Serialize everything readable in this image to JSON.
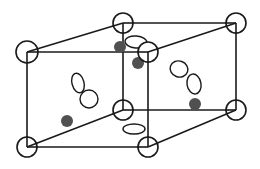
{
  "diagram": {
    "type": "crystal-lattice-unit-cells",
    "colors": {
      "line": "#1a1a1a",
      "open_atom_fill": "#ffffff",
      "filled_atom": "#505050",
      "background": "#ffffff"
    },
    "corner_atoms": [
      {
        "id": "front-top-left",
        "cx": 27,
        "cy": 52,
        "r": 11
      },
      {
        "id": "back-top-mid",
        "cx": 123,
        "cy": 23,
        "r": 10
      },
      {
        "id": "back-top-right",
        "cx": 236,
        "cy": 23,
        "r": 10
      },
      {
        "id": "front-top-mid",
        "cx": 148,
        "cy": 52,
        "r": 10
      },
      {
        "id": "back-bottom-mid",
        "cx": 123,
        "cy": 110,
        "r": 10
      },
      {
        "id": "back-bottom-right",
        "cx": 236,
        "cy": 110,
        "r": 10
      },
      {
        "id": "front-bottom-left",
        "cx": 27,
        "cy": 147,
        "r": 10
      },
      {
        "id": "front-bottom-mid",
        "cx": 148,
        "cy": 147,
        "r": 10
      }
    ],
    "edges": [
      [
        27,
        52,
        123,
        23
      ],
      [
        27,
        52,
        148,
        52
      ],
      [
        123,
        23,
        236,
        23
      ],
      [
        148,
        52,
        236,
        23
      ],
      [
        27,
        52,
        27,
        147
      ],
      [
        123,
        23,
        123,
        110
      ],
      [
        148,
        52,
        148,
        147
      ],
      [
        236,
        23,
        236,
        110
      ],
      [
        27,
        147,
        123,
        110
      ],
      [
        27,
        147,
        148,
        147
      ],
      [
        123,
        110,
        236,
        110
      ],
      [
        148,
        147,
        236,
        110
      ]
    ],
    "filled_atoms": [
      {
        "cx": 120,
        "cy": 47,
        "r": 6
      },
      {
        "cx": 138,
        "cy": 63,
        "r": 6
      },
      {
        "cx": 67,
        "cy": 121,
        "r": 6
      },
      {
        "cx": 195,
        "cy": 104,
        "r": 6
      }
    ],
    "open_ellipses": [
      {
        "cx": 136,
        "cy": 42,
        "rx": 11,
        "ry": 6,
        "rotate": 5
      },
      {
        "cx": 134,
        "cy": 129,
        "rx": 11,
        "ry": 5,
        "rotate": 0
      },
      {
        "cx": 78,
        "cy": 83,
        "rx": 6,
        "ry": 10,
        "rotate": -15
      },
      {
        "cx": 89,
        "cy": 99,
        "rx": 9,
        "ry": 9,
        "rotate": 0
      },
      {
        "cx": 179,
        "cy": 69,
        "rx": 9,
        "ry": 8,
        "rotate": 20
      },
      {
        "cx": 194,
        "cy": 84,
        "rx": 7,
        "ry": 10,
        "rotate": -10
      }
    ]
  }
}
